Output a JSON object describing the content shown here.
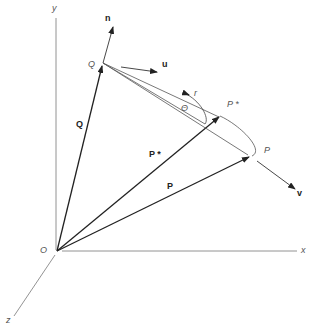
{
  "diagram": {
    "axes": {
      "x_label": "x",
      "y_label": "y",
      "z_label": "z",
      "origin_label": "O"
    },
    "points": {
      "Q": "Q",
      "P": "P",
      "P_star": "P *"
    },
    "vectors": {
      "Q": "Q",
      "P": "P",
      "P_star": "P *",
      "n": "n",
      "u": "u",
      "v": "v"
    },
    "annotations": {
      "theta": "Θ",
      "r": "r"
    },
    "colors": {
      "line": "#333333",
      "thin_line": "#666666",
      "background": "#ffffff"
    }
  }
}
